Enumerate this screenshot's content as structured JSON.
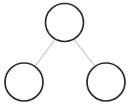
{
  "figure": {
    "kind": "node-link-diagram",
    "title": "",
    "background_color": "#ffffff",
    "width": 137,
    "height": 110
  },
  "style": {
    "node_stroke_color": "#2b2b2b",
    "node_fill_color": "#ffffff",
    "node_stroke_width": 1.7,
    "edge_stroke_color": "#b3b3b3",
    "edge_stroke_width": 1
  },
  "chart_data": {
    "type": "diagram",
    "title": "",
    "nodes": [
      {
        "id": "root",
        "label": "",
        "cx": 64.5,
        "cy": 22.5,
        "r": 19
      },
      {
        "id": "left",
        "label": "",
        "cx": 24,
        "cy": 82,
        "r": 19
      },
      {
        "id": "right",
        "label": "",
        "cx": 106,
        "cy": 82,
        "r": 19
      }
    ],
    "edges": [
      {
        "id": "root-left",
        "from": "root",
        "to": "left",
        "x1": 55,
        "y1": 39.5,
        "x2": 36,
        "y2": 65
      },
      {
        "id": "root-right",
        "from": "root",
        "to": "right",
        "x1": 74,
        "y1": 39.5,
        "x2": 94,
        "y2": 65
      }
    ],
    "legend": [],
    "annotations": []
  }
}
